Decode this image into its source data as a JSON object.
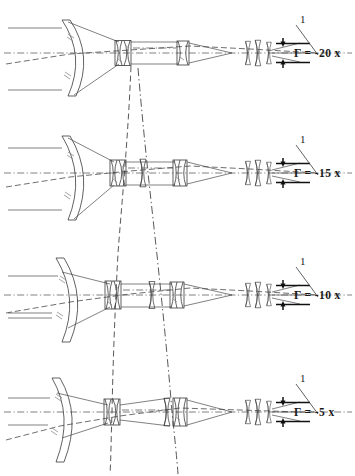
{
  "figure": {
    "background_color": "#ffffff",
    "line_color": "#3a3a3a",
    "axis_color": "#555555",
    "width": 355,
    "height": 476
  },
  "panels": [
    {
      "id": "panel-1",
      "magnification_label": "Γ = -20 x",
      "callout_label": "1",
      "objective_name": "meniscus-objective-lens",
      "group_positions": {
        "group_a_x": 123,
        "group_b_x": 183
      },
      "eyepiece_elements": 3
    },
    {
      "id": "panel-2",
      "magnification_label": "Γ = -15 x",
      "callout_label": "1",
      "objective_name": "meniscus-objective-lens",
      "group_positions": {
        "group_a_x": 118,
        "group_b_x": 178
      },
      "eyepiece_elements": 3
    },
    {
      "id": "panel-3",
      "magnification_label": "Γ = -10 x",
      "callout_label": "1",
      "objective_name": "meniscus-objective-lens",
      "group_positions": {
        "group_a_x": 113,
        "group_b_x": 175
      },
      "eyepiece_elements": 3
    },
    {
      "id": "panel-4",
      "magnification_label": "Γ = -5 x",
      "callout_label": "1",
      "objective_name": "meniscus-objective-lens",
      "group_positions": {
        "group_a_x": 112,
        "group_b_x": 180
      },
      "eyepiece_elements": 3
    }
  ],
  "annotations": {
    "exit_pupil_marker_name": "exit-pupil-dimension-arrows",
    "cam_curve_a_name": "zoom-cam-trajectory-a",
    "cam_curve_b_name": "zoom-cam-trajectory-b"
  }
}
